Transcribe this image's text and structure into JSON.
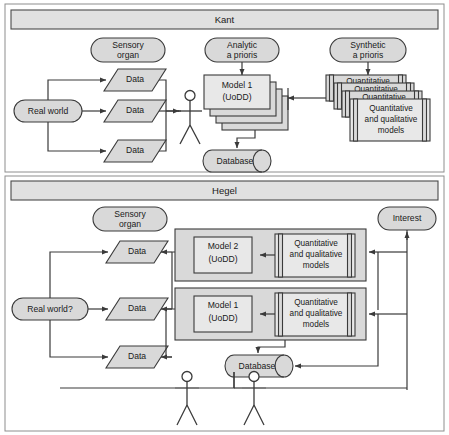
{
  "figure": {
    "type": "diagram"
  },
  "panels": [
    {
      "id": "kant",
      "title": "Kant",
      "nodes": {
        "real_world": "Real world",
        "sensory_organ": "Sensory\norgan",
        "sensory_organ_line1": "Sensory",
        "sensory_organ_line2": "organ",
        "analytic_line1": "Analytic",
        "analytic_line2": "a prioris",
        "synthetic_line1": "Synthetic",
        "synthetic_line2": "a prioris",
        "database": "Database"
      },
      "data_items": [
        "Data",
        "Data",
        "Data"
      ],
      "model_stack": {
        "front_line1": "Model 1",
        "front_line2": "(UoDD)",
        "back_line": "(UoDD)",
        "count": 4
      },
      "model_library_stack": {
        "back_label": "Quantitative",
        "front_line1": "Quantitative",
        "front_line2": "and qualitative",
        "front_line3": "models",
        "count": 4
      }
    },
    {
      "id": "hegel",
      "title": "Hegel",
      "nodes": {
        "real_world": "Real world?",
        "sensory_organ_line1": "Sensory",
        "sensory_organ_line2": "organ",
        "interest": "Interest",
        "database": "Database"
      },
      "data_items": [
        "Data",
        "Data",
        "Data"
      ],
      "rows": [
        {
          "model_line1": "Model 2",
          "model_line2": "(UoDD)",
          "library_line1": "Quantitative",
          "library_line2": "and qualitative",
          "library_line3": "models"
        },
        {
          "model_line1": "Model 1",
          "model_line2": "(UoDD)",
          "library_line1": "Quantitative",
          "library_line2": "and qualitative",
          "library_line3": "models"
        }
      ],
      "actors": [
        "actor-1",
        "actor-2"
      ]
    }
  ],
  "colors": {
    "shape_fill": "#d9d9d9",
    "light_fill": "#e8e8e8",
    "band_fill": "#e0e0e0",
    "stroke": "#3a3a3a",
    "frame": "#8e8e8e",
    "text": "#1a1a1a",
    "background": "#ffffff"
  }
}
